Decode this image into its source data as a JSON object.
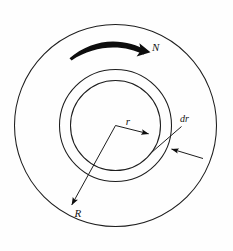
{
  "figure": {
    "background_color": "#fefefe",
    "line_color": "#1d1d1d",
    "labels": {
      "outer_radius": "R",
      "inner_radius": "r",
      "element_thickness": "dr",
      "rotation": "N"
    },
    "icons": {
      "rotation_arc": "curved-arrow-icon",
      "radius_arrow": "arrow-icon",
      "leader_arrow": "arrow-icon"
    },
    "geometry": {
      "center": {
        "x": 115.5,
        "y": 125.5
      },
      "outer_circle_radius": 101,
      "ring_outer_radius": 56,
      "ring_inner_radius": 45,
      "radius_line_R": {
        "x1": 115.5,
        "y1": 125.5,
        "x2": 70.5,
        "y2": 207
      },
      "radius_line_r": {
        "x1": 115.5,
        "y1": 125.5,
        "x2": 151.5,
        "y2": 135
      },
      "rotation_arc": {
        "start_x": 70,
        "start_y": 58,
        "peak_x": 112,
        "peak_y": 42,
        "end_x": 147,
        "end_y": 52
      },
      "dr_leader": {
        "x1": 181,
        "y1": 126,
        "x2": 152,
        "y2": 152
      },
      "dr_arrow": {
        "x1": 202,
        "y1": 158,
        "x2": 168,
        "y2": 148
      }
    },
    "label_positions": {
      "R": {
        "x": 75,
        "y": 216
      },
      "r": {
        "x": 128,
        "y": 124
      },
      "dr": {
        "x": 180,
        "y": 122
      },
      "N": {
        "x": 152,
        "y": 50
      }
    }
  }
}
